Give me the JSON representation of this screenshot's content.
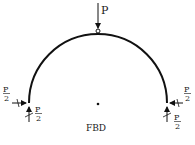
{
  "diagram": {
    "caption": "FBD",
    "load_top": {
      "label": "P"
    },
    "left_support": {
      "horizontal": {
        "num": "P",
        "den": "2"
      },
      "vertical": {
        "num": "P",
        "den": "2"
      }
    },
    "right_support": {
      "horizontal": {
        "num": "P",
        "den": "2"
      },
      "vertical": {
        "num": "P",
        "den": "2"
      }
    },
    "colors": {
      "stroke": "#111111",
      "background": "#ffffff"
    }
  }
}
